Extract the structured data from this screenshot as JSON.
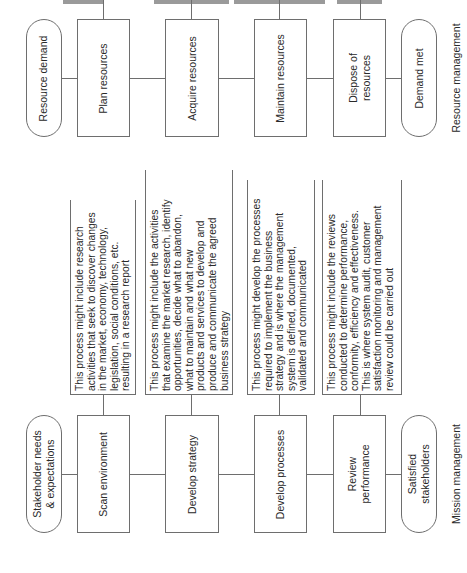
{
  "resource_management": {
    "title": "Resource management",
    "start": "Resource demand",
    "end": "Demand met",
    "steps": [
      "Plan resources",
      "Acquire resources",
      "Maintain resources",
      "Dispose of\nresources"
    ]
  },
  "mission_management": {
    "title": "Mission management",
    "start": "Stakeholder needs\n& expectations",
    "end": "Satisfied\nstakeholders",
    "steps": [
      "Scan environment",
      "Develop strategy",
      "Develop processes",
      "Review\nperformance"
    ],
    "notes": [
      "This process might include research\nactivities that seek to discover changes\nin the market, economy, technology,\nlegislation, social conditions, etc.\nresulting in a research report",
      "This process might include the activities\nthat examine the market research, identify\nopportunities, decide what to abandon,\nwhat to maintain and what new\nproducts and services to develop and\nproduce and communicate the agreed\nbusiness strategy",
      "This process might develop the processes\nrequired to implement the business\nstrategy and is where the management\nsystem is defined, documented,\nvalidated and communicated",
      "This process might include the reviews\nconducted to determine performance,\nconformity, efficiency and effectiveness.\nThis is where system audit, customer\nsatisfaction monitoring and management\nreview could be carried out"
    ]
  }
}
